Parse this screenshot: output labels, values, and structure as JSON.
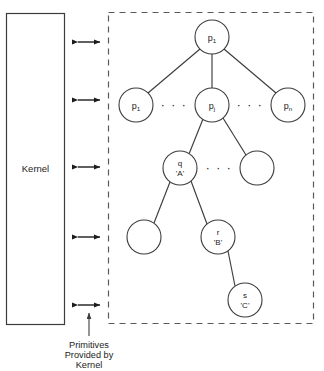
{
  "diagram": {
    "type": "process-tree-kernel-diagram",
    "kernel": {
      "label": "Kernel"
    },
    "caption": {
      "line1": "Primitives",
      "line2": "Provided by",
      "line3": "Kernel"
    },
    "colors": {
      "stroke": "#3c3c3c",
      "arrow": "#1c1c1c",
      "dashed_border": "#5a5a5a",
      "node_fill": "#ffffff",
      "background": "#ffffff",
      "text": "#1c1c1c"
    },
    "nodes": [
      {
        "id": "root",
        "base": "p",
        "sub": "1",
        "line2": "",
        "cx": 212,
        "cy": 37,
        "r": 17,
        "empty": false
      },
      {
        "id": "p1",
        "base": "p",
        "sub": "1",
        "line2": "",
        "cx": 136,
        "cy": 105,
        "r": 17,
        "empty": false
      },
      {
        "id": "pj",
        "base": "p",
        "sub": "j",
        "line2": "",
        "cx": 212,
        "cy": 105,
        "r": 17,
        "empty": false
      },
      {
        "id": "pn",
        "base": "p",
        "sub": "n",
        "line2": "",
        "cx": 288,
        "cy": 105,
        "r": 17,
        "empty": false
      },
      {
        "id": "q",
        "base": "q",
        "sub": "",
        "line2": "'A'",
        "cx": 180,
        "cy": 168,
        "r": 17,
        "empty": false
      },
      {
        "id": "qsib",
        "base": "",
        "sub": "",
        "line2": "",
        "cx": 257,
        "cy": 168,
        "r": 17,
        "empty": true
      },
      {
        "id": "rsib",
        "base": "",
        "sub": "",
        "line2": "",
        "cx": 144,
        "cy": 237,
        "r": 17,
        "empty": true
      },
      {
        "id": "r",
        "base": "r",
        "sub": "",
        "line2": "'B'",
        "cx": 218,
        "cy": 237,
        "r": 17,
        "empty": false
      },
      {
        "id": "s",
        "base": "s",
        "sub": "",
        "line2": "'C'",
        "cx": 245,
        "cy": 300,
        "r": 17,
        "empty": false
      }
    ],
    "edges": [
      {
        "from": "root",
        "to": "p1"
      },
      {
        "from": "root",
        "to": "pj"
      },
      {
        "from": "root",
        "to": "pn"
      },
      {
        "from": "pj",
        "to": "q"
      },
      {
        "from": "pj",
        "to": "qsib"
      },
      {
        "from": "q",
        "to": "rsib"
      },
      {
        "from": "q",
        "to": "r"
      },
      {
        "from": "r",
        "to": "s"
      }
    ],
    "ellipses": [
      {
        "id": "ellipsis-row2-left",
        "text": "· · ·",
        "x": 174,
        "y": 109
      },
      {
        "id": "ellipsis-row2-right",
        "text": "· · ·",
        "x": 250,
        "y": 109
      },
      {
        "id": "ellipsis-row3",
        "text": "· · ·",
        "x": 219,
        "y": 172
      }
    ],
    "arrows": [
      {
        "id": "arrow-1",
        "y": 42
      },
      {
        "id": "arrow-2",
        "y": 100
      },
      {
        "id": "arrow-3",
        "y": 167
      },
      {
        "id": "arrow-4",
        "y": 237
      },
      {
        "id": "arrow-5",
        "y": 305
      }
    ]
  }
}
